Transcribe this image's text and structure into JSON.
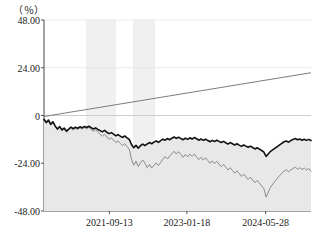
{
  "chart_data": {
    "type": "line",
    "title": "",
    "subtitle": "",
    "xlabel": "",
    "ylabel": "",
    "unit_label": "（％）",
    "ylim": [
      -48,
      48
    ],
    "yticks": [
      48,
      24,
      0,
      -24,
      -48
    ],
    "ytick_labels": [
      "48.00",
      "24.00",
      "0",
      "-24.00",
      "-48.00"
    ],
    "grid": true,
    "legend_position": "none",
    "x_axis_type": "date",
    "xlim": [
      "2021-03-01",
      "2024-12-20"
    ],
    "xticks": [
      "2021-09-13",
      "2023-01-18",
      "2024-05-28"
    ],
    "xtick_labels": [
      "2021-09-13",
      "2023-01-18",
      "2024-05-28"
    ],
    "xtick_positions_pct": [
      24.5,
      53.5,
      83.0
    ],
    "shaded_bands": [
      {
        "start_pct": 15.7,
        "end_pct": 27.0,
        "color": "#f0f0f0"
      },
      {
        "start_pct": 33.3,
        "end_pct": 41.6,
        "color": "#f0f0f0"
      }
    ],
    "series": [
      {
        "name": "fund-line",
        "color": "#111111",
        "width": 1.6,
        "fill": "#e8e8e8",
        "values": [
          -2.0,
          -3.6,
          -2.4,
          -4.5,
          -3.2,
          -5.4,
          -6.8,
          -5.6,
          -7.2,
          -6.3,
          -7.8,
          -6.9,
          -5.8,
          -6.6,
          -5.9,
          -6.4,
          -5.7,
          -6.2,
          -5.5,
          -6.0,
          -5.4,
          -6.1,
          -6.8,
          -6.2,
          -7.0,
          -7.6,
          -8.2,
          -7.5,
          -8.4,
          -9.1,
          -8.6,
          -9.4,
          -10.2,
          -9.6,
          -10.4,
          -11.0,
          -10.3,
          -11.2,
          -12.0,
          -14.6,
          -16.2,
          -15.0,
          -16.4,
          -15.2,
          -14.4,
          -15.1,
          -14.3,
          -13.6,
          -14.2,
          -13.4,
          -12.8,
          -13.5,
          -12.6,
          -11.9,
          -12.4,
          -11.6,
          -12.2,
          -11.4,
          -10.8,
          -11.5,
          -10.9,
          -11.6,
          -12.2,
          -11.4,
          -12.0,
          -11.2,
          -11.8,
          -11.1,
          -11.7,
          -12.4,
          -11.8,
          -12.5,
          -11.9,
          -12.6,
          -13.2,
          -12.5,
          -13.1,
          -12.4,
          -13.0,
          -13.6,
          -13.0,
          -13.7,
          -14.3,
          -13.6,
          -14.2,
          -14.8,
          -14.2,
          -14.9,
          -15.5,
          -14.8,
          -15.4,
          -16.0,
          -15.4,
          -16.1,
          -16.8,
          -16.2,
          -16.9,
          -17.6,
          -18.4,
          -20.6,
          -19.2,
          -18.0,
          -17.2,
          -16.4,
          -15.6,
          -14.8,
          -14.0,
          -13.2,
          -12.8,
          -13.4,
          -12.6,
          -12.0,
          -11.6,
          -12.2,
          -11.8,
          -12.4,
          -11.9,
          -12.5,
          -12.0,
          -12.6
        ]
      },
      {
        "name": "benchmark-line",
        "color": "#8a8a8a",
        "width": 1.0,
        "fill": "none",
        "values": [
          -1.5,
          -3.0,
          -1.8,
          -4.0,
          -3.0,
          -5.2,
          -7.0,
          -5.8,
          -7.6,
          -6.8,
          -8.4,
          -7.4,
          -6.2,
          -7.2,
          -6.4,
          -7.0,
          -6.2,
          -6.8,
          -6.0,
          -6.6,
          -6.0,
          -7.0,
          -8.0,
          -7.2,
          -8.4,
          -9.4,
          -10.4,
          -9.4,
          -10.8,
          -12.0,
          -11.2,
          -12.4,
          -13.6,
          -12.8,
          -14.0,
          -15.2,
          -14.2,
          -15.6,
          -17.0,
          -22.0,
          -25.0,
          -23.0,
          -25.6,
          -23.8,
          -22.4,
          -24.0,
          -26.2,
          -24.6,
          -26.4,
          -25.0,
          -23.8,
          -25.2,
          -23.6,
          -22.0,
          -20.6,
          -21.8,
          -20.4,
          -19.2,
          -18.0,
          -19.4,
          -18.2,
          -19.6,
          -21.0,
          -19.6,
          -20.8,
          -19.4,
          -20.6,
          -19.4,
          -20.8,
          -22.2,
          -21.0,
          -22.4,
          -21.2,
          -22.6,
          -24.0,
          -22.8,
          -24.2,
          -23.0,
          -24.4,
          -25.8,
          -24.6,
          -26.0,
          -27.4,
          -26.2,
          -27.6,
          -29.0,
          -27.8,
          -29.2,
          -30.6,
          -29.4,
          -30.8,
          -32.2,
          -31.0,
          -32.4,
          -33.8,
          -32.6,
          -34.0,
          -35.4,
          -36.8,
          -41.0,
          -38.4,
          -36.0,
          -34.4,
          -33.0,
          -31.6,
          -30.2,
          -29.0,
          -28.0,
          -27.2,
          -28.4,
          -27.4,
          -26.6,
          -26.0,
          -27.0,
          -26.2,
          -27.2,
          -26.4,
          -27.4,
          -26.6,
          -28.0
        ]
      },
      {
        "name": "trend-line",
        "color": "#6e6e6e",
        "width": 0.9,
        "fill": "none",
        "straight": true,
        "start_value": -0.5,
        "end_value": 21.5
      }
    ]
  }
}
